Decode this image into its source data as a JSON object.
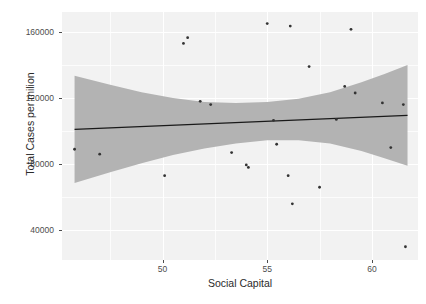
{
  "chart_data": {
    "type": "scatter",
    "title": "",
    "xlabel": "Social Capital",
    "ylabel": "Total Cases per milion",
    "xlim": [
      45.2,
      62.2
    ],
    "ylim": [
      22000,
      172000
    ],
    "xticks": [
      50,
      55,
      60
    ],
    "xticklabels": [
      "50",
      "55",
      "60"
    ],
    "yticks": [
      40000,
      80000,
      120000,
      160000
    ],
    "yticklabels": [
      "40000",
      "80000",
      "120000",
      "160000"
    ],
    "grid": true,
    "legend": "none",
    "panel_background": "#f2f2f2",
    "grid_color": "#ffffff",
    "point_color": "#333333",
    "line_color": "#1a1a1a",
    "ribbon_color": "#b3b3b3",
    "points": [
      {
        "x": 45.8,
        "y": 89000
      },
      {
        "x": 47.0,
        "y": 86000
      },
      {
        "x": 50.1,
        "y": 73000
      },
      {
        "x": 51.0,
        "y": 153000
      },
      {
        "x": 51.2,
        "y": 156500
      },
      {
        "x": 51.8,
        "y": 118000
      },
      {
        "x": 52.3,
        "y": 116000
      },
      {
        "x": 53.3,
        "y": 87000
      },
      {
        "x": 54.0,
        "y": 79500
      },
      {
        "x": 54.1,
        "y": 78000
      },
      {
        "x": 55.0,
        "y": 165000
      },
      {
        "x": 55.3,
        "y": 106500
      },
      {
        "x": 55.45,
        "y": 92000
      },
      {
        "x": 56.0,
        "y": 73000
      },
      {
        "x": 56.1,
        "y": 163500
      },
      {
        "x": 56.2,
        "y": 56000
      },
      {
        "x": 57.0,
        "y": 139000
      },
      {
        "x": 57.5,
        "y": 66000
      },
      {
        "x": 58.3,
        "y": 107000
      },
      {
        "x": 58.7,
        "y": 127000
      },
      {
        "x": 59.0,
        "y": 161500
      },
      {
        "x": 59.2,
        "y": 123000
      },
      {
        "x": 60.5,
        "y": 117000
      },
      {
        "x": 60.9,
        "y": 90000
      },
      {
        "x": 61.5,
        "y": 116000
      },
      {
        "x": 61.6,
        "y": 30000
      }
    ],
    "fit_line": {
      "x": [
        45.8,
        61.7
      ],
      "y": [
        101000,
        109500
      ],
      "label": "linear fit"
    },
    "confidence_band": {
      "x": [
        45.8,
        47.5,
        49.0,
        50.5,
        52.0,
        53.5,
        55.0,
        56.5,
        58.0,
        59.5,
        60.6,
        61.7
      ],
      "upper": [
        133500,
        128000,
        123500,
        120000,
        117500,
        117000,
        117500,
        119500,
        123500,
        129500,
        134500,
        140000
      ],
      "lower": [
        68500,
        75000,
        80500,
        85500,
        89500,
        92500,
        94500,
        94500,
        92500,
        88000,
        83500,
        79000
      ],
      "label": "95% confidence interval"
    }
  },
  "background_text": {
    "lines": [
      "are significantly higher than the number of vaccinations given",
      "percent of the population (4,953,346) the Jersey",
      "the number of vaccinations due to COVID-19 from as",
      "respectively 20 to and 1 whereas 72 degrees the",
      "in the per million data for the more. Registering"
    ],
    "lines_right": [
      "of the 57 of the",
      "confidential prediction",
      "(4-72) regression 4-4",
      "intensity",
      "for the most coefficient"
    ]
  }
}
